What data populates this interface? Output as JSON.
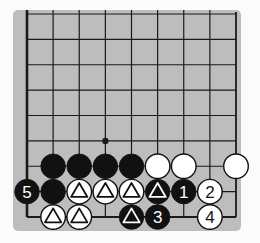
{
  "diagram": {
    "type": "go-board-fragment",
    "colors": {
      "page_bg": "#fbfbfb",
      "board_bg": "#bdbdbd",
      "line": "#1a1a1a",
      "black_stone": "#111111",
      "white_stone": "#ffffff"
    },
    "grid": {
      "columns": 9,
      "rows": 9,
      "open_edges": [
        "top"
      ],
      "closed_edges": [
        "left",
        "right",
        "bottom"
      ],
      "star_points": [
        {
          "col": 3,
          "row": 5
        }
      ]
    },
    "stones": [
      {
        "col": 1,
        "row": 6,
        "color": "black",
        "mark": ""
      },
      {
        "col": 2,
        "row": 6,
        "color": "black",
        "mark": ""
      },
      {
        "col": 3,
        "row": 6,
        "color": "black",
        "mark": ""
      },
      {
        "col": 4,
        "row": 6,
        "color": "black",
        "mark": ""
      },
      {
        "col": 5,
        "row": 6,
        "color": "white",
        "mark": ""
      },
      {
        "col": 6,
        "row": 6,
        "color": "white",
        "mark": ""
      },
      {
        "col": 8,
        "row": 6,
        "color": "white",
        "mark": ""
      },
      {
        "col": 0,
        "row": 7,
        "color": "black",
        "mark": "5"
      },
      {
        "col": 1,
        "row": 7,
        "color": "black",
        "mark": ""
      },
      {
        "col": 2,
        "row": 7,
        "color": "white",
        "mark": "triangle"
      },
      {
        "col": 3,
        "row": 7,
        "color": "white",
        "mark": "triangle"
      },
      {
        "col": 4,
        "row": 7,
        "color": "white",
        "mark": "triangle"
      },
      {
        "col": 5,
        "row": 7,
        "color": "black",
        "mark": "triangle"
      },
      {
        "col": 6,
        "row": 7,
        "color": "black",
        "mark": "1"
      },
      {
        "col": 7,
        "row": 7,
        "color": "white",
        "mark": "2"
      },
      {
        "col": 1,
        "row": 8,
        "color": "white",
        "mark": "triangle"
      },
      {
        "col": 2,
        "row": 8,
        "color": "white",
        "mark": "triangle"
      },
      {
        "col": 4,
        "row": 8,
        "color": "black",
        "mark": "triangle"
      },
      {
        "col": 5,
        "row": 8,
        "color": "black",
        "mark": "3"
      },
      {
        "col": 7,
        "row": 8,
        "color": "white",
        "mark": "4"
      }
    ]
  }
}
